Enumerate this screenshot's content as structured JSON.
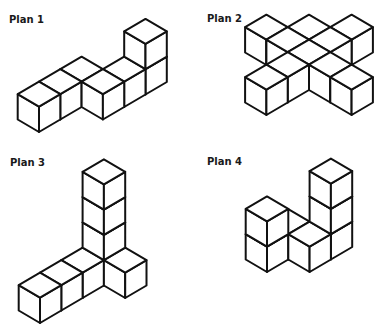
{
  "figure": {
    "background": "#ffffff",
    "line_color": "#111111",
    "iso": {
      "dx": 21.3,
      "dy": 12.5,
      "h": 25.3
    },
    "plans": [
      {
        "label": "Plan 1",
        "label_pos": [
          9,
          15
        ],
        "origin": [
          39,
          132
        ],
        "cubes": [
          [
            0,
            0,
            0
          ],
          [
            1,
            0,
            0
          ],
          [
            2,
            0,
            0
          ],
          [
            2,
            1,
            0
          ],
          [
            3,
            1,
            0
          ],
          [
            4,
            1,
            0
          ],
          [
            4,
            1,
            1
          ]
        ]
      },
      {
        "label": "Plan 2",
        "label_pos": [
          207,
          14
        ],
        "origin": [
          309,
          65
        ],
        "cubes": [
          [
            -1,
            -1,
            0
          ],
          [
            0,
            0,
            0
          ],
          [
            1,
            1,
            0
          ],
          [
            -1,
            0,
            0
          ],
          [
            0,
            1,
            0
          ],
          [
            -1,
            1,
            0
          ],
          [
            -2,
            1,
            0
          ],
          [
            -3,
            1,
            0
          ],
          [
            -1,
            2,
            0
          ],
          [
            -1,
            3,
            0
          ]
        ]
      },
      {
        "label": "Plan 3",
        "label_pos": [
          10,
          158
        ],
        "origin": [
          40,
          323
        ],
        "cubes": [
          [
            0,
            0,
            0
          ],
          [
            1,
            0,
            0
          ],
          [
            2,
            0,
            0
          ],
          [
            3,
            0,
            0
          ],
          [
            3,
            0,
            1
          ],
          [
            3,
            0,
            2
          ],
          [
            3,
            0,
            3
          ],
          [
            3,
            1,
            0
          ]
        ]
      },
      {
        "label": "Plan 4",
        "label_pos": [
          207,
          157
        ],
        "origin": [
          267,
          272
        ],
        "cubes": [
          [
            0,
            0,
            0
          ],
          [
            0,
            0,
            1
          ],
          [
            1,
            0,
            0
          ],
          [
            1,
            1,
            0
          ],
          [
            2,
            1,
            0
          ],
          [
            2,
            1,
            1
          ],
          [
            2,
            1,
            2
          ]
        ]
      }
    ]
  }
}
